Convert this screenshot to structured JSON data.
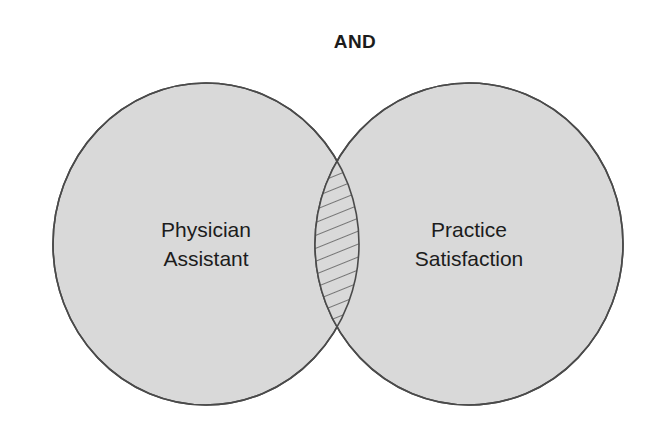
{
  "diagram": {
    "type": "venn",
    "operator_title": "AND",
    "title_position": {
      "x": 355,
      "y": 48
    },
    "background_color": "#ffffff",
    "fill_color": "#d9d9d9",
    "stroke_color": "#4a4a4a",
    "text_color": "#1c1c1c",
    "hatch_color": "#4a4a4a",
    "sets": [
      {
        "id": "left",
        "name": "physician-assistant",
        "label_line1": "Physician",
        "label_line2": "Assistant",
        "center": {
          "x": 206,
          "y": 244
        },
        "radius": {
          "rx": 153,
          "ry": 161
        },
        "label_center": {
          "x": 206,
          "y": 244
        }
      },
      {
        "id": "right",
        "name": "practice-satisfaction",
        "label_line1": "Practice",
        "label_line2": "Satisfaction",
        "center": {
          "x": 469,
          "y": 244
        },
        "radius": {
          "rx": 154,
          "ry": 161
        },
        "label_center": {
          "x": 469,
          "y": 244
        }
      }
    ],
    "intersection": {
      "name": "overlap-region",
      "fill_style": "diagonal-hatch",
      "hatch_angle_degrees": 22,
      "hatch_spacing_px": 11,
      "top_vertex": {
        "x": 337,
        "y": 148
      },
      "bottom_vertex": {
        "x": 337,
        "y": 338
      },
      "left_edge_x": 315,
      "right_edge_x": 360
    }
  }
}
